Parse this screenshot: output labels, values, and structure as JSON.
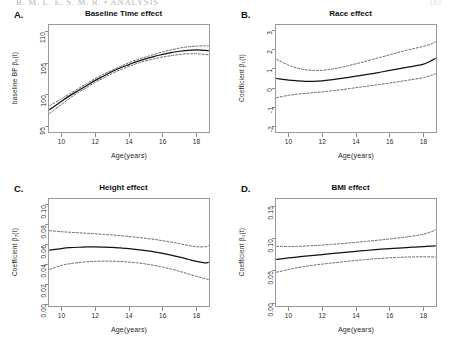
{
  "document": {
    "running_head": "R. M. L. E. S. M. R. • ANALYSIS",
    "page_number": "183"
  },
  "figure": {
    "shared_xlabel": "Age(years)",
    "xticks": [
      10,
      12,
      14,
      16,
      18
    ],
    "xlim": [
      9.2,
      18.8
    ]
  },
  "panels": [
    {
      "letter": "A.",
      "title": "Baseline Time effect",
      "ylabel": "baseline BP  β₀(t)",
      "yticks": [
        95,
        100,
        105,
        110
      ],
      "ylim": [
        94.0,
        111.2
      ]
    },
    {
      "letter": "B.",
      "title": "Race effect",
      "ylabel": "Coefficient  β₁(t)",
      "yticks": [
        -2,
        -1,
        0,
        1,
        2,
        3
      ],
      "ylim": [
        -2.35,
        3.35
      ]
    },
    {
      "letter": "C.",
      "title": "Height effect",
      "ylabel": "Coefficient  β₂(t)",
      "yticks": [
        0.0,
        0.02,
        0.04,
        0.06,
        0.08,
        0.1
      ],
      "ylim": [
        -0.003,
        0.107
      ]
    },
    {
      "letter": "D.",
      "title": "BMI effect",
      "ylabel": "Coefficient  β₃(t)",
      "yticks": [
        0.0,
        0.05,
        0.1,
        0.15
      ],
      "ylim": [
        -0.006,
        0.163
      ]
    }
  ],
  "chart_data": [
    {
      "type": "line",
      "panel": "A",
      "title": "Baseline Time effect",
      "xlabel": "Age(years)",
      "ylabel": "baseline BP β₀(t)",
      "xlim": [
        9.2,
        18.8
      ],
      "ylim": [
        94.0,
        111.2
      ],
      "grid": false,
      "legend": "none",
      "x": [
        9.3,
        10.0,
        10.5,
        11.0,
        11.5,
        12.0,
        12.5,
        13.0,
        13.5,
        14.0,
        14.5,
        15.0,
        15.5,
        16.0,
        16.5,
        17.0,
        17.5,
        18.0,
        18.5,
        18.7
      ],
      "series": [
        {
          "name": "estimate",
          "style": "solid",
          "values": [
            97.7,
            99.0,
            99.9,
            100.7,
            101.5,
            102.3,
            103.0,
            103.7,
            104.3,
            104.8,
            105.3,
            105.7,
            106.1,
            106.4,
            106.7,
            106.9,
            107.05,
            107.1,
            107.05,
            107.0
          ]
        },
        {
          "name": "upper 95% band",
          "style": "dashed",
          "values": [
            98.3,
            99.4,
            100.2,
            101.0,
            101.8,
            102.6,
            103.3,
            103.9,
            104.5,
            105.1,
            105.6,
            106.0,
            106.4,
            106.8,
            107.1,
            107.4,
            107.6,
            107.7,
            107.75,
            107.75
          ]
        },
        {
          "name": "lower 95% band",
          "style": "dashed",
          "values": [
            97.1,
            98.5,
            99.5,
            100.4,
            101.2,
            102.0,
            102.7,
            103.4,
            104.0,
            104.5,
            105.0,
            105.4,
            105.7,
            106.0,
            106.2,
            106.4,
            106.5,
            106.5,
            106.4,
            106.35
          ]
        }
      ]
    },
    {
      "type": "line",
      "panel": "B",
      "title": "Race effect",
      "xlabel": "Age(years)",
      "ylabel": "Coefficient β₁(t)",
      "xlim": [
        9.2,
        18.8
      ],
      "ylim": [
        -2.35,
        3.35
      ],
      "grid": false,
      "legend": "none",
      "x": [
        9.3,
        10.0,
        10.5,
        11.0,
        11.5,
        12.0,
        12.5,
        13.0,
        13.5,
        14.0,
        14.5,
        15.0,
        15.5,
        16.0,
        16.5,
        17.0,
        17.5,
        18.0,
        18.5,
        18.7
      ],
      "series": [
        {
          "name": "estimate",
          "style": "solid",
          "values": [
            0.5,
            0.42,
            0.38,
            0.35,
            0.35,
            0.38,
            0.43,
            0.49,
            0.55,
            0.62,
            0.69,
            0.76,
            0.84,
            0.92,
            1.0,
            1.08,
            1.16,
            1.25,
            1.45,
            1.55
          ]
        },
        {
          "name": "upper 95% band",
          "style": "dashed",
          "values": [
            1.5,
            1.2,
            1.05,
            0.96,
            0.92,
            0.93,
            0.98,
            1.06,
            1.16,
            1.27,
            1.38,
            1.5,
            1.62,
            1.74,
            1.86,
            1.98,
            2.08,
            2.18,
            2.32,
            2.42
          ]
        },
        {
          "name": "lower 95% band",
          "style": "dashed",
          "values": [
            -0.5,
            -0.38,
            -0.32,
            -0.28,
            -0.24,
            -0.2,
            -0.15,
            -0.1,
            -0.04,
            0.02,
            0.08,
            0.14,
            0.2,
            0.26,
            0.33,
            0.4,
            0.47,
            0.55,
            0.68,
            0.74
          ]
        }
      ]
    },
    {
      "type": "line",
      "panel": "C",
      "title": "Height effect",
      "xlabel": "Age(years)",
      "ylabel": "Coefficient β₂(t)",
      "xlim": [
        9.2,
        18.8
      ],
      "ylim": [
        -0.003,
        0.107
      ],
      "grid": false,
      "legend": "none",
      "x": [
        9.3,
        10.0,
        10.5,
        11.0,
        11.5,
        12.0,
        12.5,
        13.0,
        13.5,
        14.0,
        14.5,
        15.0,
        15.5,
        16.0,
        16.5,
        17.0,
        17.5,
        18.0,
        18.5,
        18.7
      ],
      "series": [
        {
          "name": "estimate",
          "style": "solid",
          "values": [
            0.0545,
            0.056,
            0.0568,
            0.0573,
            0.0576,
            0.0577,
            0.0575,
            0.0572,
            0.0566,
            0.0559,
            0.055,
            0.0539,
            0.0526,
            0.0511,
            0.0494,
            0.0474,
            0.0452,
            0.043,
            0.0415,
            0.042
          ]
        },
        {
          "name": "upper 95% band",
          "style": "dashed",
          "values": [
            0.074,
            0.073,
            0.0724,
            0.0719,
            0.0714,
            0.0709,
            0.0703,
            0.0697,
            0.069,
            0.0682,
            0.0673,
            0.0663,
            0.0652,
            0.0639,
            0.0625,
            0.0609,
            0.0592,
            0.0578,
            0.0578,
            0.059
          ]
        },
        {
          "name": "lower 95% band",
          "style": "dashed",
          "values": [
            0.035,
            0.039,
            0.0407,
            0.0418,
            0.0426,
            0.0431,
            0.0433,
            0.0432,
            0.0429,
            0.0423,
            0.0415,
            0.0404,
            0.039,
            0.0373,
            0.0353,
            0.033,
            0.0305,
            0.028,
            0.0255,
            0.025
          ]
        }
      ]
    },
    {
      "type": "line",
      "panel": "D",
      "title": "BMI effect",
      "xlabel": "Age(years)",
      "ylabel": "Coefficient β₃(t)",
      "xlim": [
        9.2,
        18.8
      ],
      "ylim": [
        -0.006,
        0.163
      ],
      "grid": false,
      "legend": "none",
      "x": [
        9.3,
        10.0,
        10.5,
        11.0,
        11.5,
        12.0,
        12.5,
        13.0,
        13.5,
        14.0,
        14.5,
        15.0,
        15.5,
        16.0,
        16.5,
        17.0,
        17.5,
        18.0,
        18.5,
        18.7
      ],
      "series": [
        {
          "name": "estimate",
          "style": "solid",
          "values": [
            0.068,
            0.07,
            0.0714,
            0.0727,
            0.074,
            0.0753,
            0.0766,
            0.0779,
            0.0791,
            0.0803,
            0.0815,
            0.0826,
            0.0836,
            0.0845,
            0.0854,
            0.0862,
            0.0869,
            0.0876,
            0.0884,
            0.0888
          ]
        },
        {
          "name": "upper 95% band",
          "style": "dashed",
          "values": [
            0.088,
            0.0878,
            0.088,
            0.0885,
            0.0892,
            0.09,
            0.091,
            0.092,
            0.0931,
            0.0943,
            0.0955,
            0.0968,
            0.0981,
            0.0995,
            0.101,
            0.1026,
            0.1045,
            0.107,
            0.111,
            0.1135
          ]
        },
        {
          "name": "lower 95% band",
          "style": "dashed",
          "values": [
            0.048,
            0.0522,
            0.0548,
            0.057,
            0.0588,
            0.0605,
            0.062,
            0.0635,
            0.0649,
            0.0662,
            0.0674,
            0.0685,
            0.0694,
            0.0702,
            0.0709,
            0.0714,
            0.0717,
            0.0718,
            0.0716,
            0.0714
          ]
        }
      ]
    }
  ]
}
